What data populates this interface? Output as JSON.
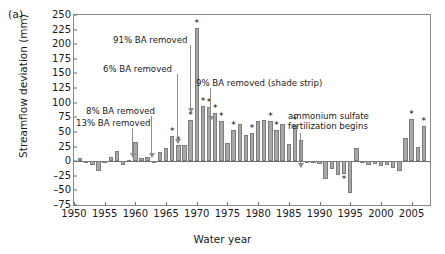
{
  "panel": {
    "label": "(a)"
  },
  "axes": {
    "ylabel": "Streamflow deviation (mm)",
    "xlabel": "Water year",
    "yticks": [
      250,
      225,
      200,
      175,
      150,
      125,
      100,
      75,
      50,
      25,
      0,
      -25,
      -50,
      -75
    ],
    "yticklabels": [
      "250",
      "225",
      "200",
      "175",
      "150",
      "125",
      "100",
      "75",
      "50",
      "25",
      "0",
      "–25",
      "–50",
      "–75"
    ],
    "xticks": [
      1950,
      1955,
      1960,
      1965,
      1970,
      1975,
      1980,
      1985,
      1990,
      1995,
      2000,
      2005
    ],
    "xticklabels": [
      "1950",
      "1955",
      "1960",
      "1965",
      "1970",
      "1975",
      "1980",
      "1985",
      "1990",
      "1995",
      "2000",
      "2005"
    ]
  },
  "annotations": [
    {
      "id": "ba-13",
      "text": "13% BA removed",
      "label_x": 76,
      "label_y": 118,
      "arrow_x": 132,
      "arrow_top": 128,
      "arrow_len": 29
    },
    {
      "id": "ba-8",
      "text": "8% BA removed",
      "label_x": 86,
      "label_y": 106,
      "arrow_x": 151,
      "arrow_top": 116,
      "arrow_len": 41
    },
    {
      "id": "ba-6",
      "text": "6% BA removed",
      "label_x": 103,
      "label_y": 64,
      "arrow_x": 177,
      "arrow_top": 74,
      "arrow_len": 69
    },
    {
      "id": "ba-91",
      "text": "91% BA removed",
      "label_x": 113,
      "label_y": 35,
      "arrow_x": 190,
      "arrow_top": 45,
      "arrow_len": 67
    },
    {
      "id": "ba-9",
      "text": "9% BA removed (shade strip)",
      "label_x": 196,
      "label_y": 78,
      "arrow_x": 210,
      "arrow_top": 88,
      "arrow_len": 32
    },
    {
      "id": "amm-sulf",
      "text": "ammonium sulfate\nfertilization begins",
      "label_x": 288,
      "label_y": 111,
      "arrow_x": 300,
      "arrow_top": 133,
      "arrow_len": 34
    }
  ],
  "chart_data": {
    "type": "bar",
    "title": "",
    "xlabel": "Water year",
    "ylabel": "Streamflow deviation (mm)",
    "xlim": [
      1950,
      2008
    ],
    "ylim": [
      -75,
      250
    ],
    "grid": false,
    "legend": null,
    "bar_color": "#a8a8a8",
    "significance_marker": "*",
    "x": [
      1951,
      1952,
      1953,
      1954,
      1955,
      1956,
      1957,
      1958,
      1959,
      1960,
      1961,
      1962,
      1963,
      1964,
      1965,
      1966,
      1967,
      1968,
      1969,
      1970,
      1971,
      1972,
      1973,
      1974,
      1975,
      1976,
      1977,
      1978,
      1979,
      1980,
      1981,
      1982,
      1983,
      1984,
      1985,
      1986,
      1987,
      1988,
      1989,
      1990,
      1991,
      1992,
      1993,
      1994,
      1995,
      1996,
      1997,
      1998,
      1999,
      2000,
      2001,
      2002,
      2003,
      2004,
      2005,
      2006,
      2007
    ],
    "values": [
      5,
      -4,
      -6,
      -17,
      -1,
      7,
      18,
      -6,
      2,
      33,
      5,
      7,
      -1,
      16,
      22,
      43,
      27,
      28,
      71,
      228,
      95,
      93,
      82,
      68,
      31,
      53,
      63,
      44,
      48,
      68,
      71,
      68,
      54,
      63,
      30,
      61,
      37,
      -2,
      -3,
      -5,
      -30,
      -13,
      -23,
      -22,
      -55,
      22,
      1,
      -6,
      -5,
      -9,
      -7,
      -11,
      -17,
      40,
      72,
      25,
      60
    ],
    "significant_years": [
      1966,
      1967,
      1969,
      1970,
      1971,
      1972,
      1973,
      1974,
      1976,
      1979,
      1982,
      1983,
      1986,
      1994,
      2005,
      2007
    ],
    "series": [
      {
        "name": "streamflow deviation",
        "values": [
          5,
          -4,
          -6,
          -17,
          -1,
          7,
          18,
          -6,
          2,
          33,
          5,
          7,
          -1,
          16,
          22,
          43,
          27,
          28,
          71,
          228,
          95,
          93,
          82,
          68,
          31,
          53,
          63,
          44,
          48,
          68,
          71,
          68,
          54,
          63,
          30,
          61,
          37,
          -2,
          -3,
          -5,
          -30,
          -13,
          -23,
          -22,
          -55,
          22,
          1,
          -6,
          -5,
          -9,
          -7,
          -11,
          -17,
          40,
          72,
          25,
          60
        ]
      }
    ],
    "annotations": [
      {
        "text": "13% BA removed",
        "year": 1961
      },
      {
        "text": "8% BA removed",
        "year": 1963
      },
      {
        "text": "6% BA removed",
        "year": 1967
      },
      {
        "text": "91% BA removed",
        "year": 1969
      },
      {
        "text": "9% BA removed (shade strip)",
        "year": 1972
      },
      {
        "text": "ammonium sulfate fertilization begins",
        "year": 1988
      }
    ]
  }
}
